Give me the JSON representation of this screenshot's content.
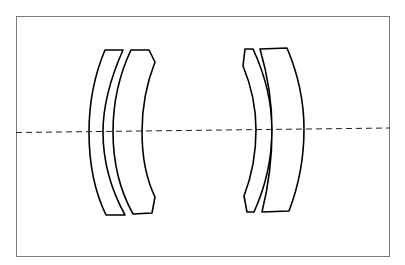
{
  "diagram": {
    "type": "optical-lens-cross-section",
    "canvas": {
      "width": 405,
      "height": 265,
      "background": "#ffffff"
    },
    "frame": {
      "x1": 16,
      "y1": 17,
      "x2": 390,
      "y2": 257,
      "stroke": "#7a7a7a"
    },
    "optical_axis": {
      "style": "dashed",
      "x1": 16,
      "y1": 132.5,
      "x2": 390,
      "y2": 128,
      "stroke": "#222222"
    },
    "groups": [
      {
        "name": "front-group",
        "elements": [
          {
            "name": "lens-element-1",
            "shape": "positive-meniscus",
            "edge_top_y": 50,
            "edge_bottom_y": 215
          },
          {
            "name": "lens-element-2",
            "shape": "negative-meniscus",
            "edge_top_y": 50,
            "edge_bottom_y": 215
          }
        ]
      },
      {
        "name": "rear-group",
        "elements": [
          {
            "name": "lens-element-3",
            "shape": "negative-meniscus",
            "edge_top_y": 49,
            "edge_bottom_y": 212
          },
          {
            "name": "lens-element-4",
            "shape": "positive-meniscus",
            "edge_top_y": 48,
            "edge_bottom_y": 212
          }
        ]
      }
    ],
    "colors": {
      "lens_stroke": "#000000",
      "lens_fill": "#ffffff"
    }
  }
}
